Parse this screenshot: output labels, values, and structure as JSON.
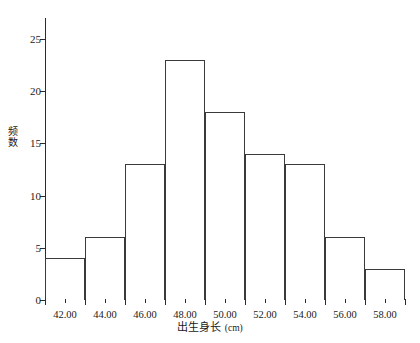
{
  "chart_data": {
    "type": "bar",
    "title": "",
    "subtitle": "",
    "xlabel": "出生身长 (cm)",
    "xlabel_main": "出生身长",
    "xlabel_unit": "(cm)",
    "ylabel": "频数",
    "ylabel_chars": [
      "频",
      "数"
    ],
    "xlim": [
      41.0,
      59.0
    ],
    "ylim": [
      0,
      27
    ],
    "grid": false,
    "legend": null,
    "bin_width": 2.0,
    "bin_edges": [
      41.0,
      43.0,
      45.0,
      47.0,
      49.0,
      51.0,
      53.0,
      55.0,
      57.0,
      59.0
    ],
    "categories": [
      "41-43",
      "43-45",
      "45-47",
      "47-49",
      "49-51",
      "51-53",
      "53-55",
      "55-57",
      "57-59"
    ],
    "values": [
      4,
      6,
      13,
      23,
      18,
      14,
      13,
      6,
      3
    ],
    "bar_edge_color": "#3a3a3a",
    "bar_fill_color": "#ffffff",
    "axis_color": "#2b2b2b",
    "x_ticks": [
      {
        "value": 42.0,
        "label": "42.00"
      },
      {
        "value": 44.0,
        "label": "44.00"
      },
      {
        "value": 46.0,
        "label": "46.00"
      },
      {
        "value": 48.0,
        "label": "48.00"
      },
      {
        "value": 50.0,
        "label": "50.00"
      },
      {
        "value": 52.0,
        "label": "52.00"
      },
      {
        "value": 54.0,
        "label": "54.00"
      },
      {
        "value": 56.0,
        "label": "56.00"
      },
      {
        "value": 58.0,
        "label": "58.00"
      }
    ],
    "x_tick_labels": [
      "42.00",
      "44.00",
      "46.00",
      "48.00",
      "50.00",
      "52.00",
      "54.00",
      "56.00",
      "58.00"
    ],
    "y_ticks": [
      0,
      5,
      10,
      15,
      20,
      25
    ],
    "y_tick_labels": [
      "0",
      "5",
      "10",
      "15",
      "20",
      "25"
    ]
  }
}
